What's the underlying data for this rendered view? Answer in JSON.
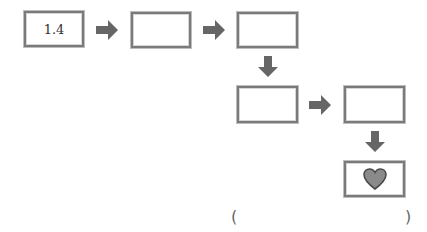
{
  "diagram": {
    "boxes": [
      {
        "id": "box-1",
        "value": "1.4"
      },
      {
        "id": "box-2",
        "value": ""
      },
      {
        "id": "box-3",
        "value": ""
      },
      {
        "id": "box-4",
        "value": ""
      },
      {
        "id": "box-5",
        "value": ""
      },
      {
        "id": "box-6",
        "value": "",
        "icon": "heart-icon"
      }
    ],
    "arrows": [
      {
        "from": "box-1",
        "to": "box-2",
        "direction": "right"
      },
      {
        "from": "box-2",
        "to": "box-3",
        "direction": "right"
      },
      {
        "from": "box-3",
        "to": "box-4",
        "direction": "down"
      },
      {
        "from": "box-4",
        "to": "box-5",
        "direction": "right"
      },
      {
        "from": "box-5",
        "to": "box-6",
        "direction": "down"
      }
    ],
    "answer": {
      "open_paren": "(",
      "value": "",
      "close_paren": ")"
    },
    "colors": {
      "arrow": "#666666",
      "border": "#7a7a7a",
      "heart_fill": "#8a8a8a",
      "heart_stroke": "#4a4a4a"
    }
  }
}
